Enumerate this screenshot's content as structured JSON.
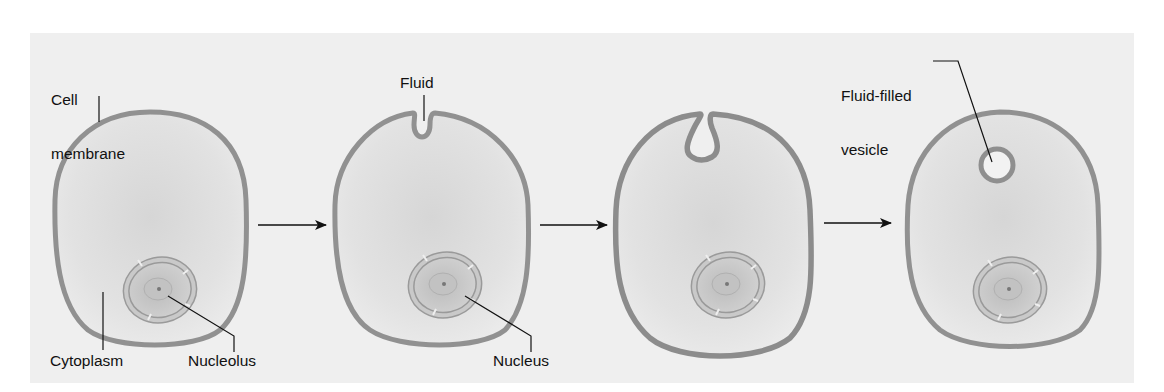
{
  "figure": {
    "type": "pinocytosis-diagram",
    "panel_background": "#efefef",
    "membrane_color": "#8f8f8f",
    "cytoplasm_color": "#dcdcdc",
    "nucleus_color": "#c4c4c4",
    "line_color": "#111111",
    "stages": [
      {
        "id": "stage-1",
        "description": "Cell with intact cell membrane"
      },
      {
        "id": "stage-2",
        "description": "Membrane indents to take in fluid"
      },
      {
        "id": "stage-3",
        "description": "Membrane pinches around fluid"
      },
      {
        "id": "stage-4",
        "description": "Fluid-filled vesicle inside cell"
      }
    ]
  },
  "labels": {
    "cell_membrane_line1": "Cell",
    "cell_membrane_line2": "membrane",
    "cytoplasm": "Cytoplasm",
    "nucleolus": "Nucleolus",
    "fluid": "Fluid",
    "nucleus": "Nucleus",
    "vesicle_line1": "Fluid-filled",
    "vesicle_line2": "vesicle"
  },
  "arrows": [
    {
      "from": "stage-1",
      "to": "stage-2"
    },
    {
      "from": "stage-2",
      "to": "stage-3"
    },
    {
      "from": "stage-3",
      "to": "stage-4"
    }
  ]
}
